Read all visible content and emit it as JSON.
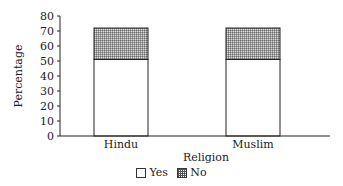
{
  "chart_data": {
    "type": "bar",
    "stacked": true,
    "title": "",
    "xlabel": "Religion",
    "ylabel": "Percentage",
    "categories": [
      "Hindu",
      "Muslim"
    ],
    "series": [
      {
        "name": "Yes",
        "values": [
          51,
          51
        ],
        "fill": "#ffffff"
      },
      {
        "name": "No",
        "values": [
          21,
          21
        ],
        "fill": "crosshatch"
      }
    ],
    "ylim": [
      0,
      80
    ],
    "yticks": [
      0,
      10,
      20,
      30,
      40,
      50,
      60,
      70,
      80
    ],
    "grid": false,
    "legend_position": "bottom"
  },
  "legend": {
    "items": [
      {
        "label": "Yes"
      },
      {
        "label": "No"
      }
    ]
  }
}
